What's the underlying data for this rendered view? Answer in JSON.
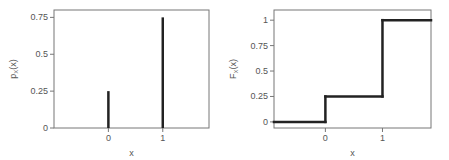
{
  "chart_data": [
    {
      "type": "bar",
      "subtype": "stem",
      "title": "",
      "xlabel": "x",
      "ylabel_main": "p",
      "ylabel_sub": "X",
      "ylabel_tail": "(x)",
      "x": [
        0,
        1
      ],
      "values": [
        0.25,
        0.75
      ],
      "xlim": [
        -1,
        1.85
      ],
      "ylim": [
        0,
        0.8
      ],
      "xticks": [
        0,
        1
      ],
      "xtick_labels": [
        "0",
        "1"
      ],
      "yticks": [
        0,
        0.25,
        0.5,
        0.75
      ],
      "ytick_labels": [
        "0",
        "0.25",
        "0.5",
        "0.75"
      ],
      "grid": false,
      "color": "#222222"
    },
    {
      "type": "line",
      "subtype": "step",
      "title": "",
      "xlabel": "x",
      "ylabel_main": "F",
      "ylabel_sub": "X",
      "ylabel_tail": "(x)",
      "x": [
        -0.9,
        0,
        0,
        1,
        1,
        1.85
      ],
      "y": [
        0,
        0,
        0.25,
        0.25,
        1,
        1
      ],
      "xlim": [
        -0.9,
        1.85
      ],
      "ylim": [
        -0.06,
        1.1
      ],
      "xticks": [
        0,
        1
      ],
      "xtick_labels": [
        "0",
        "1"
      ],
      "yticks": [
        0,
        0.25,
        0.5,
        0.75,
        1
      ],
      "ytick_labels": [
        "0",
        "0.25",
        "0.5",
        "0.75",
        "1"
      ],
      "grid": false,
      "color": "#222222"
    }
  ]
}
